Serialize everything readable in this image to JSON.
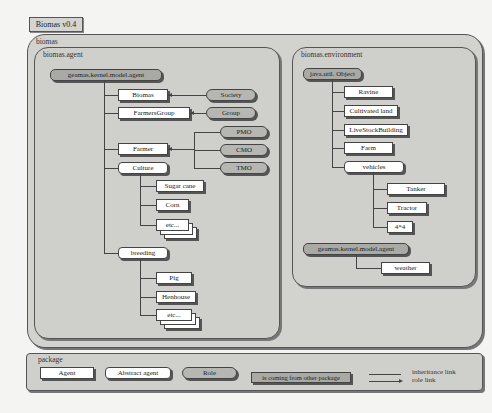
{
  "title": "Biomas v0.4",
  "outer_package": "biomas",
  "agent_package": {
    "label": "biomas.agent",
    "root": "geamas.kernel.model.agent",
    "children": [
      {
        "label": "Biomas",
        "abstract": false
      },
      {
        "label": "FarmersGroup",
        "abstract": false
      },
      {
        "label": "Farmer",
        "abstract": false
      },
      {
        "label": "Culture",
        "abstract": true,
        "children": [
          "Sugar cane",
          "Corn",
          "etc..."
        ]
      },
      {
        "label": "breeding",
        "abstract": true,
        "children": [
          "Pig",
          "Henhouse",
          "etc..."
        ]
      }
    ],
    "roles": [
      "Society",
      "Group",
      "PMO",
      "CMO",
      "TMO"
    ]
  },
  "environment_package": {
    "label": "biomas.environment",
    "root": "java.util. Object",
    "children": [
      "Ravine",
      "Cultivated land",
      "LiveStockBuilding",
      "Farm",
      "vehicles"
    ],
    "vehicles_children": [
      "Tanker",
      "Tractor",
      "4*4"
    ],
    "agent_root": "geamas.kernel.model.agent",
    "agent_children": [
      "weather"
    ]
  },
  "legend": {
    "label": "package",
    "agent": "Agent",
    "abstract_agent": "Abstract agent",
    "role": "Role",
    "external": "is coming from other package",
    "inheritance_link": "inheritance link",
    "role_link": "role link"
  }
}
